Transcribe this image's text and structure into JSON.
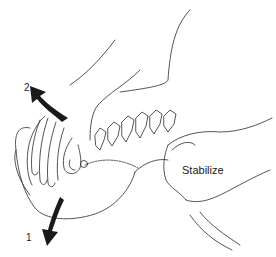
{
  "figure": {
    "labels": {
      "stabilize": "Stabilize",
      "arrow_1": "1",
      "arrow_2": "2"
    },
    "arrows": [
      {
        "id": "1",
        "direction": "down",
        "color": "#1a1a1a"
      },
      {
        "id": "2",
        "direction": "up-left",
        "color": "#1a1a1a"
      }
    ],
    "colors": {
      "line": "#2a2a2a",
      "background": "#ffffff",
      "arrow_fill": "#1a1a1a"
    }
  }
}
